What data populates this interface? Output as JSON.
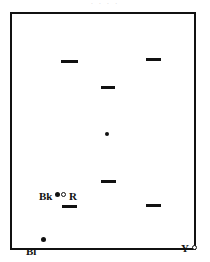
{
  "figure": {
    "top_caption_fragment": "·   ·   · ·",
    "frame": {
      "x": 10,
      "y": 12,
      "width": 186,
      "height": 238,
      "border_color": "#111111",
      "background": "#ffffff"
    }
  },
  "chart_data": {
    "type": "scatter",
    "title": "",
    "subtitle": "",
    "xlabel": "",
    "ylabel": "",
    "xlim": [
      0,
      186
    ],
    "ylim": [
      0,
      238
    ],
    "grid": false,
    "legend": "none",
    "axis_ticks": false,
    "marker_styles": {
      "dash": "short horizontal filled bar",
      "dot": "small filled circle",
      "circle": "small open circle"
    },
    "points": [
      {
        "id": "p1",
        "label": "",
        "marker": "dash",
        "x": 49,
        "y": 46,
        "w": 17,
        "h": 3,
        "color": "#111111"
      },
      {
        "id": "p2",
        "label": "",
        "marker": "dash",
        "x": 134,
        "y": 44,
        "w": 15,
        "h": 3,
        "color": "#111111"
      },
      {
        "id": "p3",
        "label": "",
        "marker": "dash",
        "x": 89,
        "y": 72,
        "w": 14,
        "h": 3,
        "color": "#111111"
      },
      {
        "id": "p4",
        "label": "",
        "marker": "dot",
        "x": 93,
        "y": 118,
        "w": 4,
        "h": 4,
        "color": "#111111"
      },
      {
        "id": "p5",
        "label": "",
        "marker": "dash",
        "x": 89,
        "y": 166,
        "w": 15,
        "h": 3,
        "color": "#111111"
      },
      {
        "id": "p6",
        "label": "",
        "marker": "dash",
        "x": 50,
        "y": 191,
        "w": 15,
        "h": 3,
        "color": "#111111"
      },
      {
        "id": "p7",
        "label": "",
        "marker": "dash",
        "x": 134,
        "y": 190,
        "w": 15,
        "h": 3,
        "color": "#111111"
      },
      {
        "id": "p8",
        "label": "Bk",
        "marker": "dot",
        "x": 43,
        "y": 178,
        "w": 5,
        "h": 5,
        "color": "#111111"
      },
      {
        "id": "p9",
        "label": "R",
        "marker": "circle",
        "x": 49,
        "y": 178,
        "w": 5,
        "h": 5,
        "color": "#111111"
      },
      {
        "id": "p10",
        "label": "Bl",
        "marker": "dot",
        "x": 29,
        "y": 223,
        "w": 5,
        "h": 5,
        "color": "#111111"
      },
      {
        "id": "p11",
        "label": "Y",
        "marker": "circle",
        "x": 180,
        "y": 231,
        "w": 5,
        "h": 5,
        "color": "#111111"
      }
    ],
    "labels": [
      {
        "id": "l-bk",
        "text": "Bk",
        "x": 27,
        "y": 177,
        "anchor": "left",
        "meaning": "black reference point"
      },
      {
        "id": "l-r",
        "text": "R",
        "x": 57,
        "y": 177,
        "anchor": "left",
        "meaning": "red reference point"
      },
      {
        "id": "l-bl",
        "text": "Bl",
        "x": 14,
        "y": 232,
        "anchor": "left",
        "meaning": "blue reference point"
      },
      {
        "id": "l-y",
        "text": "Y",
        "x": 169,
        "y": 229,
        "anchor": "left",
        "meaning": "yellow reference point"
      }
    ]
  }
}
